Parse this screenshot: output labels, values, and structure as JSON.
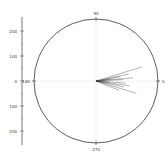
{
  "chart_data": {
    "type": "polar",
    "title": "",
    "angular_labels": [
      {
        "angle": 90,
        "label": "90"
      },
      {
        "angle": 270,
        "label": "270"
      },
      {
        "angle": 0,
        "label": "0"
      },
      {
        "angle": 180,
        "label": "180"
      }
    ],
    "radial_axis": {
      "ticks": [
        200,
        100,
        0,
        100,
        200
      ],
      "range": [
        -250,
        250
      ]
    },
    "grid": true,
    "series": [
      {
        "name": "vectors",
        "color": "#333333",
        "lines": [
          {
            "angle": 17,
            "r": 195
          },
          {
            "angle": 12,
            "r": 135
          },
          {
            "angle": 10,
            "r": 100
          },
          {
            "angle": 5,
            "r": 150
          },
          {
            "angle": 3,
            "r": 110
          },
          {
            "angle": -4,
            "r": 120
          },
          {
            "angle": -8,
            "r": 135
          },
          {
            "angle": -12,
            "r": 115
          },
          {
            "angle": -17,
            "r": 170
          },
          {
            "angle": -22,
            "r": 100
          },
          {
            "angle": 7,
            "r": 60
          },
          {
            "angle": -6,
            "r": 55
          }
        ]
      }
    ]
  },
  "labels": {
    "top": "90",
    "bottom": "270",
    "right": "0",
    "left": "180",
    "y_ticks": [
      "200",
      "100",
      "0",
      "100",
      "200"
    ]
  }
}
